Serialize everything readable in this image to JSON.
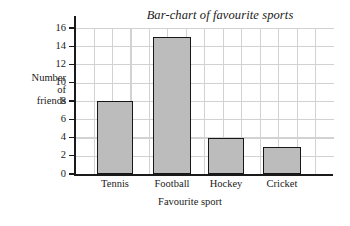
{
  "chart_data": {
    "type": "bar",
    "title": "Bar-chart of favourite sports",
    "xlabel": "Favourite sport",
    "ylabel_lines": [
      "Number",
      "of",
      "friends"
    ],
    "ylabel": "Number of friends",
    "categories": [
      "Tennis",
      "Football",
      "Hockey",
      "Cricket"
    ],
    "values": [
      8,
      15,
      4,
      3
    ],
    "ylim": [
      0,
      16
    ],
    "ytick_values": [
      0,
      2,
      4,
      6,
      8,
      10,
      12,
      14,
      16
    ],
    "ytick_labels": [
      "0",
      "2",
      "4",
      "6",
      "8",
      "10",
      "12",
      "14",
      "16"
    ],
    "grid": true,
    "legend": null,
    "bar_fill_color": "#bcbcbc",
    "bar_border_color": "#171717",
    "grid_color": "#d2d2d2",
    "axis_color": "#1a1a1a",
    "background_color": "#ffffff"
  }
}
